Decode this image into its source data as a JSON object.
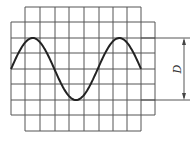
{
  "figure": {
    "type": "oscilloscope-screen",
    "dimension_label": "D",
    "colors": {
      "grid": "#555555",
      "trace": "#222222",
      "background": "#ffffff"
    }
  },
  "grid": {
    "outer_rect": {
      "x1": 11,
      "y1": 22,
      "x2": 155,
      "y2": 115
    },
    "inner_cols_top": 7,
    "inner_cols_bottom": 131,
    "vertical_lines": [
      25,
      40,
      55,
      69,
      84,
      99,
      113,
      127,
      141
    ],
    "horizontal_lines": [
      7,
      22,
      38,
      53,
      69,
      84,
      100,
      115,
      131
    ]
  },
  "trace": {
    "x_start": 11,
    "x_end": 141,
    "center_y": 69,
    "amplitude": 31,
    "period_px": 86.7,
    "cycles_shown": 1.5
  },
  "dimension": {
    "label": "D",
    "top_y": 38,
    "bottom_y": 100,
    "arrow_x": 184,
    "ext_x1": 141,
    "ext_x2": 190
  }
}
